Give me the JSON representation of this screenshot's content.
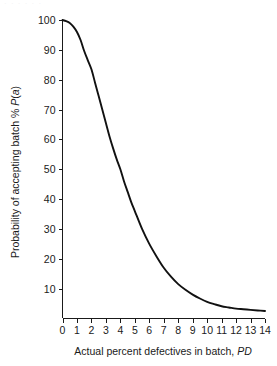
{
  "figure": {
    "background_color": "#ffffff",
    "curve_color": "#111111",
    "axis_color": "#1a1a1a",
    "text_color": "#1a1a1a",
    "top_edge_artifact": "· · · · · ·"
  },
  "chart_data": {
    "type": "line",
    "title": "",
    "subtitle": "",
    "xlabel_plain": "Actual percent defectives in batch, PD",
    "xlabel_prefix": "Actual percent defectives in batch, ",
    "xlabel_italic": "PD",
    "ylabel_plain": "Probability of accepting batch % P(a)",
    "ylabel_prefix": "Probability of accepting batch % ",
    "ylabel_italic_p": "P",
    "ylabel_paren_open": "(",
    "ylabel_italic_a": "a",
    "ylabel_paren_close": ")",
    "xlim": [
      0,
      14
    ],
    "ylim": [
      0,
      100
    ],
    "xticks": [
      0,
      1,
      2,
      3,
      4,
      5,
      6,
      7,
      8,
      9,
      10,
      11,
      12,
      13,
      14
    ],
    "xticklabels": [
      "0",
      "1",
      "2",
      "3",
      "4",
      "5",
      "6",
      "7",
      "8",
      "9",
      "10",
      "11",
      "12",
      "13",
      "14"
    ],
    "yticks": [
      10,
      20,
      30,
      40,
      50,
      60,
      70,
      80,
      90,
      100
    ],
    "yticklabels": [
      "10",
      "20",
      "30",
      "40",
      "50",
      "60",
      "70",
      "80",
      "90",
      "100"
    ],
    "grid": false,
    "legend": false,
    "legend_position": "none",
    "series": [
      {
        "name": "Operating characteristic curve",
        "x": [
          0,
          0.25,
          0.5,
          0.75,
          1,
          1.25,
          1.5,
          1.75,
          2,
          2.25,
          2.5,
          2.75,
          3,
          3.25,
          3.5,
          3.75,
          4,
          4.25,
          4.5,
          4.75,
          5,
          5.5,
          6,
          6.5,
          7,
          7.5,
          8,
          8.5,
          9,
          9.5,
          10,
          10.5,
          11,
          11.5,
          12,
          12.5,
          13,
          13.5,
          14
        ],
        "values": [
          100,
          99.6,
          99,
          97.8,
          96,
          93.3,
          89.6,
          86.5,
          83.5,
          79,
          74.5,
          70,
          65.5,
          61,
          57,
          53.3,
          50,
          46,
          42.5,
          39,
          36,
          30,
          25,
          20.8,
          17,
          14,
          11.5,
          9.6,
          8,
          6.7,
          5.6,
          4.8,
          4.1,
          3.7,
          3.3,
          3.1,
          2.9,
          2.7,
          2.5
        ]
      }
    ],
    "annotations": []
  }
}
